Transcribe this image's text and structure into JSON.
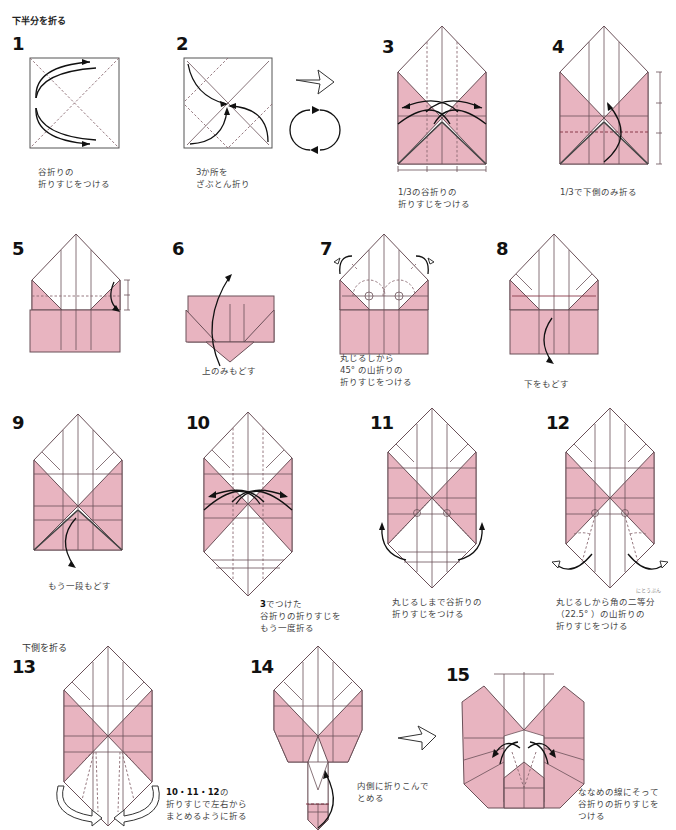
{
  "sections": {
    "lower_half": "下半分を折る",
    "lower_side": "下側を折る"
  },
  "steps": [
    {
      "num": "1",
      "caption": "谷折りの\n折りすじをつける"
    },
    {
      "num": "2",
      "caption": "3か所を\nざぶとん折り"
    },
    {
      "num": "3",
      "caption": "1/3の谷折りの\n折りすじをつける"
    },
    {
      "num": "4",
      "caption": "1/3で下側のみ折る"
    },
    {
      "num": "5",
      "caption": ""
    },
    {
      "num": "6",
      "caption": "上のみもどす"
    },
    {
      "num": "7",
      "caption": "丸じるしから\n45° の山折りの\n折りすじをつける"
    },
    {
      "num": "8",
      "caption": "下をもどす"
    },
    {
      "num": "9",
      "caption": "もう一段もどす"
    },
    {
      "num": "10",
      "caption_bold": "3",
      "caption": "でつけた\n谷折りの折りすじを\nもう一度折る"
    },
    {
      "num": "11",
      "caption": "丸じるしまで谷折りの\n折りすじをつける"
    },
    {
      "num": "12",
      "caption": "丸じるしから角の二等分\n（22.5° ）の山折りの\n折りすじをつける",
      "ruby": "にとうぶん"
    },
    {
      "num": "13",
      "caption_bold": "10・11・12",
      "caption": "の\n折りすじで左右から\nまとめるように折る"
    },
    {
      "num": "14",
      "caption": "内側に折りこんで\nとめる"
    },
    {
      "num": "15",
      "caption": "ななめの線にそって\n谷折りの折りすじを\nつける"
    }
  ],
  "symbols": {
    "turn_over": "rotate-icon",
    "next": "hollow-arrow-icon"
  },
  "colors": {
    "paper_pink": "#e8b4c0",
    "line": "#6a5058",
    "arrow": "#111111"
  }
}
